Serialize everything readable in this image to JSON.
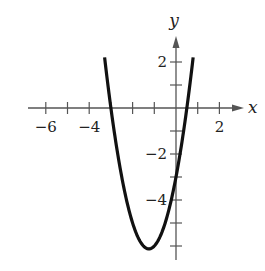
{
  "chart_data": {
    "type": "line",
    "title": "",
    "xlabel": "x",
    "ylabel": "y",
    "function": "y = 2x^2 + 5x - 3",
    "xlim": [
      -6.8,
      3.0
    ],
    "ylim": [
      -6.6,
      3.0
    ],
    "grid": false,
    "x_ticks": [
      -6,
      -5,
      -4,
      -3,
      -2,
      -1,
      1,
      2
    ],
    "y_ticks": [
      -6,
      -5,
      -4,
      -3,
      -2,
      -1,
      1,
      2
    ],
    "x_tick_labels": [
      {
        "value": -6,
        "label": "−6"
      },
      {
        "value": -4,
        "label": "−4"
      },
      {
        "value": 2,
        "label": "2"
      }
    ],
    "y_tick_labels": [
      {
        "value": 2,
        "label": "2"
      },
      {
        "value": -2,
        "label": "−2"
      },
      {
        "value": -4,
        "label": "−4"
      }
    ],
    "series": [
      {
        "name": "parabola",
        "color": "#111111",
        "x": [
          -3.29,
          -3.0,
          -2.5,
          -2.0,
          -1.5,
          -1.25,
          -1.0,
          -0.5,
          0.0,
          0.5,
          0.79
        ],
        "y": [
          2.21,
          0.0,
          -3.0,
          -5.0,
          -6.0,
          -6.125,
          -6.0,
          -5.0,
          -3.0,
          0.0,
          2.2
        ]
      }
    ],
    "key_points": {
      "x_intercepts": [
        -3,
        0.5
      ],
      "y_intercept": -3,
      "vertex": [
        -1.25,
        -6.125
      ]
    }
  },
  "layout": {
    "origin_px": [
      176,
      108
    ],
    "x_unit_px": 21.7,
    "y_unit_px": 23
  }
}
